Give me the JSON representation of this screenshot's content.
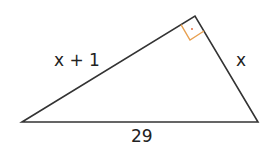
{
  "diagram": {
    "type": "right-triangle",
    "labels": {
      "leg_left": "x + 1",
      "leg_right": "x",
      "hypotenuse": "29"
    },
    "right_angle_marker": "right-angle-square",
    "colors": {
      "stroke": "#333333",
      "marker": "#e8a050",
      "marker_dot": "#e06030"
    }
  }
}
